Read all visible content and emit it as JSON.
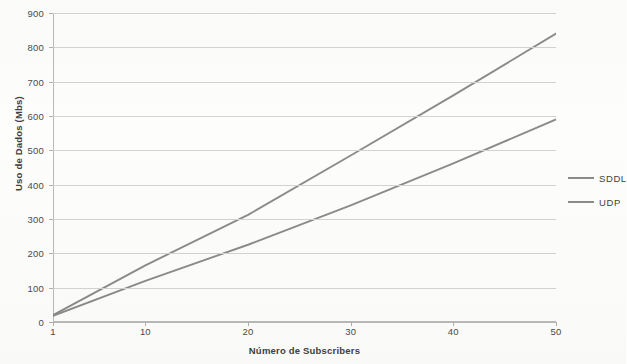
{
  "chart_data": {
    "type": "line",
    "title": "",
    "xlabel": "Número de Subscribers",
    "ylabel": "Uso de Dados (Mbs)",
    "xlim": [
      1,
      50
    ],
    "ylim": [
      0,
      900
    ],
    "grid": true,
    "legend_position": "right",
    "x_ticks": [
      "1",
      "10",
      "20",
      "30",
      "40",
      "50"
    ],
    "x_tick_values": [
      1,
      10,
      20,
      30,
      40,
      50
    ],
    "y_ticks": [
      "0",
      "100",
      "200",
      "300",
      "400",
      "500",
      "600",
      "700",
      "800",
      "900"
    ],
    "y_tick_values": [
      0,
      100,
      200,
      300,
      400,
      500,
      600,
      700,
      800,
      900
    ],
    "x": [
      1,
      10,
      20,
      30,
      40,
      50
    ],
    "series": [
      {
        "name": "SDDL",
        "color": "#8b8b8b",
        "values": [
          20,
          165,
          312,
          485,
          660,
          840
        ]
      },
      {
        "name": "UDP",
        "color": "#8b8b8b",
        "values": [
          18,
          120,
          225,
          340,
          462,
          590
        ]
      }
    ]
  },
  "legend": {
    "items": [
      {
        "label": "SDDL",
        "color": "#8b8b8b"
      },
      {
        "label": "UDP",
        "color": "#8b8b8b"
      }
    ]
  }
}
